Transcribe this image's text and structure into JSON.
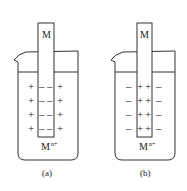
{
  "figure": {
    "panels": [
      {
        "id": "a",
        "caption": "(a)",
        "electrode_label": "M",
        "ion_label": "M",
        "ion_superscript": "n+",
        "electrode_charge": "-",
        "solution_charge": "+",
        "rows": 4
      },
      {
        "id": "b",
        "caption": "(b)",
        "electrode_label": "M",
        "ion_label": "M",
        "ion_superscript": "n+",
        "electrode_charge": "+",
        "solution_charge": "-",
        "rows": 4
      }
    ]
  }
}
